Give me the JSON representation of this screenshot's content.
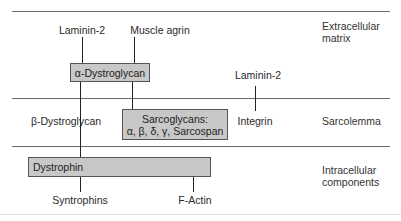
{
  "diagram": {
    "regions": [
      {
        "lines": [
          "Extracellular",
          "matrix"
        ]
      },
      {
        "lines": [
          "Sarcolemma"
        ]
      },
      {
        "lines": [
          "Intracellular",
          "components"
        ]
      }
    ],
    "boxes": {
      "alpha_dystroglycan": "α-Dystroglycan",
      "sarcoglycans_title": "Sarcoglycans:",
      "sarcoglycans_list": "α, β, δ, γ, Sarcospan",
      "dystrophin": "Dystrophin"
    },
    "labels": {
      "laminin_left": "Laminin-2",
      "muscle_agrin": "Muscle agrin",
      "laminin_right": "Laminin-2",
      "beta_dystroglycan": "β-Dystroglycan",
      "integrin": "Integrin",
      "syntrophins": "Syntrophins",
      "f_actin": "F-Actin"
    },
    "colors": {
      "box_fill": "#c8c8c8",
      "box_border": "#555555",
      "divider": "#6a6a6a"
    }
  }
}
